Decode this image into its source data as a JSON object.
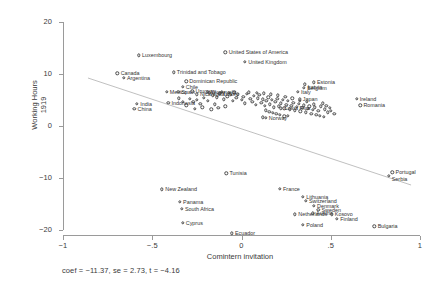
{
  "chart_data": {
    "type": "scatter",
    "title": "",
    "xlabel": "Comintern invitation",
    "ylabel_line1": "Working Hours",
    "ylabel_line2": "1919",
    "caption": "coef = −11.37, se = 2.73, t = −4.16",
    "xlim": [
      -1.08,
      1.05
    ],
    "ylim": [
      -22.5,
      22.0
    ],
    "xticks": [
      -1,
      -0.5,
      0,
      0.5,
      1
    ],
    "xticklabels": [
      "−1",
      "−.5",
      "0",
      ".5",
      "1"
    ],
    "yticks": [
      20,
      10,
      0,
      -10,
      -20
    ],
    "yticklabels": [
      "20",
      "10",
      "0",
      "−10",
      "−20"
    ],
    "grid": false,
    "legend": false,
    "fit": {
      "slope": -11.37,
      "intercept": -0.55,
      "se": 2.73,
      "t": -4.16,
      "x0": -0.86,
      "x1": 0.95,
      "color": "#b9b9b9"
    },
    "marker": {
      "shape": "circle-open",
      "color": "#4a4a4a",
      "size": 3.4
    },
    "points": [
      {
        "label": "Luxembourg",
        "x": -0.575,
        "y": 13.6,
        "lx": "right"
      },
      {
        "label": "United States of America",
        "x": -0.09,
        "y": 14.2,
        "lx": "right"
      },
      {
        "label": "United Kingdom",
        "x": 0.02,
        "y": 12.3,
        "lx": "right"
      },
      {
        "label": "Trinidad and Tobago",
        "x": -0.38,
        "y": 10.3,
        "lx": "right"
      },
      {
        "label": "Canada",
        "x": -0.695,
        "y": 10.1,
        "lx": "right"
      },
      {
        "label": "Argentina",
        "x": -0.66,
        "y": 9.3,
        "lx": "right"
      },
      {
        "label": "Dominican Republic",
        "x": -0.31,
        "y": 8.6,
        "lx": "right"
      },
      {
        "label": "Estonia",
        "x": 0.405,
        "y": 8.4,
        "lx": "right"
      },
      {
        "label": "Latvia",
        "x": 0.355,
        "y": 8.0,
        "lx": "left"
      },
      {
        "label": "Belgium",
        "x": 0.35,
        "y": 7.4,
        "lx": "right"
      },
      {
        "label": "Chile",
        "x": -0.33,
        "y": 7.5,
        "lx": "right"
      },
      {
        "label": "Mexico",
        "x": -0.42,
        "y": 6.6,
        "lx": "right"
      },
      {
        "label": "Spain",
        "x": -0.355,
        "y": 6.6,
        "lx": "right"
      },
      {
        "label": "Italy",
        "x": 0.315,
        "y": 6.6,
        "lx": "right"
      },
      {
        "label": "Japan",
        "x": 0.325,
        "y": 5.1,
        "lx": "right"
      },
      {
        "label": "Ireland",
        "x": 0.645,
        "y": 5.2,
        "lx": "right"
      },
      {
        "label": "Romania",
        "x": 0.665,
        "y": 4.0,
        "lx": "right"
      },
      {
        "label": "Uruguay",
        "x": -0.275,
        "y": 6.7,
        "lx": "right"
      },
      {
        "label": "Venezuela",
        "x": -0.19,
        "y": 6.6,
        "lx": "right"
      },
      {
        "label": "Nicaragua",
        "x": -0.25,
        "y": 6.1,
        "lx": "right"
      },
      {
        "label": "Turkey",
        "x": -0.125,
        "y": 6.2,
        "lx": "right"
      },
      {
        "label": "India",
        "x": -0.585,
        "y": 4.3,
        "lx": "right"
      },
      {
        "label": "Indonesia",
        "x": -0.41,
        "y": 4.5,
        "lx": "right"
      },
      {
        "label": "China",
        "x": -0.6,
        "y": 3.3,
        "lx": "right"
      },
      {
        "label": "Costa Rica",
        "x": 0.22,
        "y": 3.4,
        "lx": "right"
      },
      {
        "label": "Norway",
        "x": 0.135,
        "y": 1.6,
        "lx": "right"
      },
      {
        "label": "Portugal",
        "x": 0.845,
        "y": -8.9,
        "lx": "right"
      },
      {
        "label": "Serbia",
        "x": 0.825,
        "y": -9.6,
        "lx": "left"
      },
      {
        "label": "Tunisia",
        "x": -0.085,
        "y": -9.1,
        "lx": "right"
      },
      {
        "label": "New Zealand",
        "x": -0.445,
        "y": -12.2,
        "lx": "right"
      },
      {
        "label": "France",
        "x": 0.215,
        "y": -12.1,
        "lx": "right"
      },
      {
        "label": "Lithuania",
        "x": 0.345,
        "y": -13.6,
        "lx": "right"
      },
      {
        "label": "Switzerland",
        "x": 0.36,
        "y": -14.4,
        "lx": "right"
      },
      {
        "label": "Denmark",
        "x": 0.405,
        "y": -15.3,
        "lx": "right"
      },
      {
        "label": "Sweden",
        "x": 0.43,
        "y": -16.1,
        "lx": "right"
      },
      {
        "label": "Austria",
        "x": 0.4,
        "y": -16.8,
        "lx": "right"
      },
      {
        "label": "Netherlands",
        "x": 0.3,
        "y": -17.0,
        "lx": "right"
      },
      {
        "label": "Panama",
        "x": -0.345,
        "y": -14.6,
        "lx": "right"
      },
      {
        "label": "South Africa",
        "x": -0.335,
        "y": -15.9,
        "lx": "right"
      },
      {
        "label": "Cyprus",
        "x": -0.33,
        "y": -18.6,
        "lx": "right"
      },
      {
        "label": "Ecuador",
        "x": -0.055,
        "y": -20.6,
        "lx": "right"
      },
      {
        "label": "Kosovo",
        "x": 0.505,
        "y": -17.0,
        "lx": "right"
      },
      {
        "label": "Finland",
        "x": 0.535,
        "y": -17.9,
        "lx": "right"
      },
      {
        "label": "Poland",
        "x": 0.345,
        "y": -19.0,
        "lx": "right"
      },
      {
        "label": "Bulgaria",
        "x": 0.745,
        "y": -19.3,
        "lx": "right"
      }
    ],
    "cluster_points": [
      {
        "x": -0.16,
        "y": 5.9
      },
      {
        "x": -0.14,
        "y": 5.5
      },
      {
        "x": -0.12,
        "y": 6.3
      },
      {
        "x": -0.1,
        "y": 5.1
      },
      {
        "x": -0.08,
        "y": 5.7
      },
      {
        "x": -0.06,
        "y": 6.0
      },
      {
        "x": -0.05,
        "y": 4.8
      },
      {
        "x": -0.03,
        "y": 5.4
      },
      {
        "x": -0.02,
        "y": 6.1
      },
      {
        "x": 0.0,
        "y": 5.0
      },
      {
        "x": 0.01,
        "y": 5.6
      },
      {
        "x": 0.02,
        "y": 4.4
      },
      {
        "x": 0.03,
        "y": 6.2
      },
      {
        "x": 0.05,
        "y": 5.2
      },
      {
        "x": 0.06,
        "y": 4.7
      },
      {
        "x": 0.07,
        "y": 5.8
      },
      {
        "x": 0.08,
        "y": 4.1
      },
      {
        "x": 0.09,
        "y": 5.3
      },
      {
        "x": 0.1,
        "y": 6.0
      },
      {
        "x": 0.11,
        "y": 4.5
      },
      {
        "x": 0.12,
        "y": 5.1
      },
      {
        "x": 0.13,
        "y": 3.9
      },
      {
        "x": 0.14,
        "y": 4.9
      },
      {
        "x": 0.15,
        "y": 5.5
      },
      {
        "x": 0.16,
        "y": 4.2
      },
      {
        "x": 0.17,
        "y": 5.0
      },
      {
        "x": 0.18,
        "y": 3.6
      },
      {
        "x": 0.19,
        "y": 4.6
      },
      {
        "x": 0.2,
        "y": 5.2
      },
      {
        "x": 0.21,
        "y": 3.8
      },
      {
        "x": 0.22,
        "y": 4.4
      },
      {
        "x": 0.23,
        "y": 5.0
      },
      {
        "x": 0.24,
        "y": 3.4
      },
      {
        "x": 0.25,
        "y": 4.1
      },
      {
        "x": 0.26,
        "y": 4.8
      },
      {
        "x": 0.27,
        "y": 3.2
      },
      {
        "x": 0.28,
        "y": 3.9
      },
      {
        "x": 0.29,
        "y": 4.5
      },
      {
        "x": 0.3,
        "y": 3.0
      },
      {
        "x": 0.31,
        "y": 3.7
      },
      {
        "x": 0.32,
        "y": 4.3
      },
      {
        "x": 0.33,
        "y": 2.8
      },
      {
        "x": 0.34,
        "y": 3.5
      },
      {
        "x": 0.35,
        "y": 4.0
      },
      {
        "x": 0.36,
        "y": 2.6
      },
      {
        "x": 0.37,
        "y": 3.3
      },
      {
        "x": 0.38,
        "y": 3.8
      },
      {
        "x": 0.39,
        "y": 2.4
      },
      {
        "x": 0.4,
        "y": 3.1
      },
      {
        "x": 0.41,
        "y": 3.6
      },
      {
        "x": 0.42,
        "y": 2.2
      },
      {
        "x": 0.43,
        "y": 2.9
      },
      {
        "x": -0.19,
        "y": 4.9
      },
      {
        "x": -0.21,
        "y": 5.4
      },
      {
        "x": -0.23,
        "y": 4.3
      },
      {
        "x": -0.25,
        "y": 5.0
      },
      {
        "x": -0.27,
        "y": 4.6
      },
      {
        "x": -0.29,
        "y": 5.2
      },
      {
        "x": -0.31,
        "y": 4.0
      },
      {
        "x": -0.33,
        "y": 4.7
      },
      {
        "x": -0.35,
        "y": 5.3
      },
      {
        "x": -0.18,
        "y": 6.4
      },
      {
        "x": -0.15,
        "y": 4.2
      },
      {
        "x": -0.11,
        "y": 6.6
      },
      {
        "x": -0.07,
        "y": 6.4
      },
      {
        "x": -0.04,
        "y": 6.5
      },
      {
        "x": 0.04,
        "y": 6.5
      },
      {
        "x": 0.085,
        "y": 6.4
      },
      {
        "x": 0.125,
        "y": 6.3
      },
      {
        "x": 0.165,
        "y": 6.1
      },
      {
        "x": 0.205,
        "y": 5.9
      },
      {
        "x": 0.245,
        "y": 5.6
      },
      {
        "x": 0.285,
        "y": 5.3
      },
      {
        "x": 0.325,
        "y": 4.9
      },
      {
        "x": 0.365,
        "y": 4.6
      },
      {
        "x": 0.405,
        "y": 4.2
      },
      {
        "x": 0.445,
        "y": 3.8
      },
      {
        "x": 0.465,
        "y": 3.2
      },
      {
        "x": 0.485,
        "y": 2.6
      },
      {
        "x": 0.135,
        "y": 3.0
      },
      {
        "x": 0.155,
        "y": 2.7
      },
      {
        "x": 0.175,
        "y": 2.5
      },
      {
        "x": 0.195,
        "y": 2.3
      },
      {
        "x": 0.215,
        "y": 2.1
      },
      {
        "x": -0.09,
        "y": 3.8
      },
      {
        "x": -0.13,
        "y": 3.5
      },
      {
        "x": -0.17,
        "y": 3.2
      },
      {
        "x": -0.22,
        "y": 3.6
      },
      {
        "x": -0.26,
        "y": 3.3
      },
      {
        "x": 0.455,
        "y": 4.4
      },
      {
        "x": 0.475,
        "y": 3.9
      },
      {
        "x": 0.495,
        "y": 3.5
      },
      {
        "x": 0.5,
        "y": 2.9
      },
      {
        "x": 0.52,
        "y": 2.4
      },
      {
        "x": 0.44,
        "y": 2.0
      },
      {
        "x": 0.46,
        "y": 1.8
      },
      {
        "x": 0.24,
        "y": 1.9
      },
      {
        "x": 0.26,
        "y": 2.0
      },
      {
        "x": 0.12,
        "y": 1.7
      }
    ]
  }
}
